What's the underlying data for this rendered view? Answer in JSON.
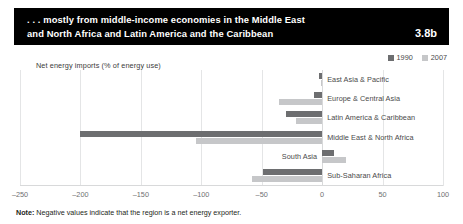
{
  "banner": {
    "title": "... mostly from middle-income economies in the Middle East and North Africa and Latin America and the Caribbean",
    "title_line1": ". . . mostly from middle-income economies in the Middle East",
    "title_line2": "and North Africa and Latin America and the Caribbean",
    "figure_number": "3.8b",
    "background_color": "#000000",
    "text_color": "#ffffff"
  },
  "note": {
    "label": "Note:",
    "text": " Negative values indicate that the region is a net energy exporter."
  },
  "colors": {
    "series_1990": "#6d6e70",
    "series_2007": "#c6c7c9",
    "gridline": "#e4e5e6"
  },
  "chart_data": {
    "type": "bar",
    "orientation": "horizontal",
    "title": "Net energy imports (% of energy use)",
    "xlabel": "",
    "ylabel": "",
    "xlim": [
      -250,
      100
    ],
    "xticks": [
      -250,
      -200,
      -150,
      -100,
      -50,
      0,
      50,
      100
    ],
    "xticklabels": [
      "–250",
      "–200",
      "–150",
      "–100",
      "–50",
      "0",
      "50",
      "100"
    ],
    "grid": true,
    "legend_position": "top-right",
    "categories": [
      "East Asia & Pacific",
      "Europe & Central Asia",
      "Latin America & Caribbean",
      "Middle East & North Africa",
      "South Asia",
      "Sub-Saharan Africa"
    ],
    "series": [
      {
        "name": "1990",
        "color": "#6d6e70",
        "values": [
          -3,
          -7,
          -30,
          -200,
          10,
          -49
        ]
      },
      {
        "name": "2007",
        "color": "#c6c7c9",
        "values": [
          -1,
          -36,
          -22,
          -104,
          20,
          -58
        ]
      }
    ]
  }
}
